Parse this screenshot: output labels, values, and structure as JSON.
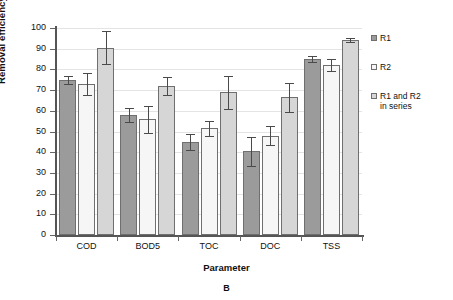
{
  "chart_data": {
    "type": "bar",
    "title": "",
    "panel_label": "B",
    "xlabel": "Parameter",
    "ylabel": "Removal efficiency (%)",
    "categories": [
      "COD",
      "BOD5",
      "TOC",
      "DOC",
      "TSS"
    ],
    "ylim": [
      0,
      100
    ],
    "yticks": [
      0,
      10,
      20,
      30,
      40,
      50,
      60,
      70,
      80,
      90,
      100
    ],
    "grid": true,
    "legend_position": "right",
    "series": [
      {
        "name": "R1",
        "color": "#9b9b9b",
        "values": [
          75,
          58,
          45,
          40.5,
          85
        ],
        "errors": [
          2,
          3.5,
          4,
          7,
          1.5
        ]
      },
      {
        "name": "R2",
        "color": "#f6f6f6",
        "values": [
          73,
          56,
          51.5,
          48,
          82
        ],
        "errors": [
          5.5,
          6.5,
          3.5,
          4.5,
          3
        ]
      },
      {
        "name": "R1 and R2\nin series",
        "color": "#d6d6d6",
        "values": [
          90.5,
          72,
          69,
          66.5,
          94
        ],
        "errors": [
          8,
          4.5,
          8,
          7,
          1
        ]
      }
    ]
  }
}
